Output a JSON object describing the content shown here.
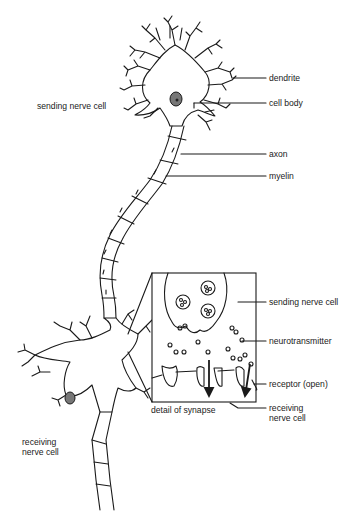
{
  "diagram": {
    "type": "neuron-synapse-illustration",
    "labels": {
      "sending_cell": "sending nerve cell",
      "dendrite": "dendrite",
      "cell_body": "cell body",
      "axon": "axon",
      "myelin": "myelin",
      "inset_sending_cell": "sending nerve cell",
      "neurotransmitter": "neurotransmitter",
      "receptor": "receptor (open)",
      "detail_caption": "detail of synapse",
      "inset_receiving_cell_line1": "receiving",
      "inset_receiving_cell_line2": "nerve cell",
      "receiving_cell_line1": "receiving",
      "receiving_cell_line2": "nerve cell"
    },
    "colors": {
      "ink": "#1a1a1a",
      "background": "#ffffff",
      "nucleus": "#777777"
    }
  }
}
